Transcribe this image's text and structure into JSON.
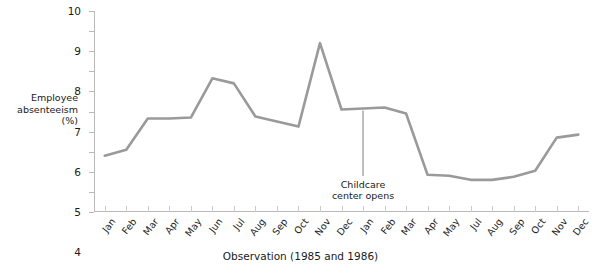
{
  "chart_data": {
    "type": "line",
    "title": "",
    "xlabel": "Observation (1985 and 1986)",
    "ylabel": "Employee absenteeism (%)",
    "ylabel_lines": [
      "Employee",
      "absenteeism",
      "(%)"
    ],
    "ylim": [
      0,
      10
    ],
    "ytick_values": [
      0,
      1,
      2,
      3,
      4,
      5,
      6,
      7,
      8,
      9,
      10
    ],
    "ytick_labels": [
      "0",
      "1",
      "2",
      "3",
      "4",
      "5",
      "6",
      "7",
      "8",
      "9",
      "10"
    ],
    "grid": false,
    "legend": null,
    "series_color": "#9a9a9a",
    "categories": [
      "Jan",
      "Feb",
      "Mar",
      "Apr",
      "May",
      "Jun",
      "Jul",
      "Aug",
      "Sep",
      "Oct",
      "Nov",
      "Dec",
      "Jan",
      "Feb",
      "Mar",
      "Apr",
      "May",
      "Jul",
      "Aug",
      "Sep",
      "Oct",
      "Nov",
      "Dec"
    ],
    "values": [
      2.8,
      3.1,
      4.65,
      4.65,
      4.7,
      6.65,
      6.4,
      4.75,
      4.5,
      4.25,
      8.4,
      5.1,
      5.15,
      5.2,
      4.9,
      1.85,
      1.8,
      1.6,
      1.6,
      1.75,
      2.05,
      3.7,
      3.85
    ],
    "annotations": [
      {
        "text_lines": [
          "Childcare",
          "center opens"
        ],
        "target_index": 12,
        "target_value": 5.15
      }
    ]
  }
}
